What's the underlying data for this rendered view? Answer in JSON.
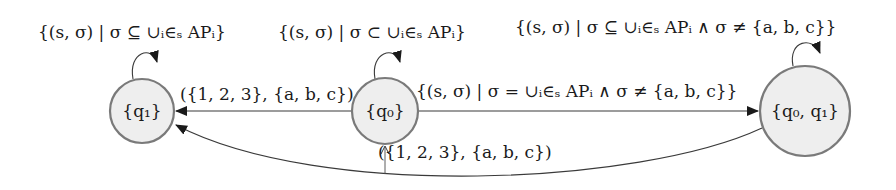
{
  "diagram": {
    "type": "state-automaton",
    "states": [
      {
        "id": "q1",
        "label": "{q₁}"
      },
      {
        "id": "q0",
        "label": "{q₀}",
        "initial": true
      },
      {
        "id": "q0q1",
        "label": "{q₀, q₁}"
      }
    ],
    "transitions": [
      {
        "from": "q1",
        "to": "q1",
        "label": "{(s, σ) | σ ⊆ ∪ᵢ∈ₛ APᵢ}"
      },
      {
        "from": "q0",
        "to": "q0",
        "label": "{(s, σ) | σ ⊂ ∪ᵢ∈ₛ APᵢ}"
      },
      {
        "from": "q0q1",
        "to": "q0q1",
        "label": "{(s, σ) | σ ⊆ ∪ᵢ∈ₛ APᵢ ∧ σ ≠ {a, b, c}}"
      },
      {
        "from": "q0",
        "to": "q1",
        "label": "({1, 2, 3}, {a, b, c})"
      },
      {
        "from": "q0",
        "to": "q0q1",
        "label": "{(s, σ) | σ = ∪ᵢ∈ₛ APᵢ ∧ σ ≠ {a, b, c}}"
      },
      {
        "from": "q0q1",
        "to": "q1",
        "label": "({1, 2, 3}, {a, b, c})"
      }
    ]
  }
}
